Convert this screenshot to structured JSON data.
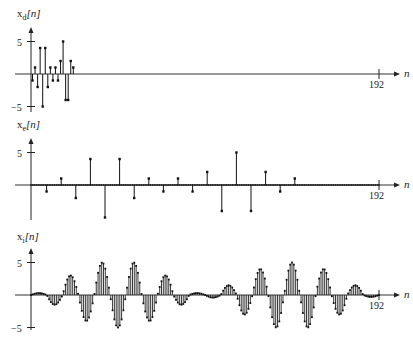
{
  "chart_data": [
    {
      "type": "stem",
      "title": "",
      "ylabel": "x_d[n]",
      "xlabel": "n",
      "x_end_tick": "192",
      "yticks": [
        "5",
        "-5"
      ],
      "ylim": [
        -5,
        5
      ],
      "xlim": [
        0,
        192
      ],
      "x": [
        0,
        1,
        2,
        3,
        4,
        5,
        6,
        7,
        8,
        9,
        10,
        11,
        12,
        13,
        14,
        15,
        16
      ],
      "values": [
        -1,
        1,
        -2,
        4,
        -5,
        4,
        -2,
        1,
        -1,
        1,
        -1,
        2,
        5,
        -4,
        -4,
        2,
        1
      ]
    },
    {
      "type": "stem",
      "title": "",
      "ylabel": "x_e[n]",
      "xlabel": "n",
      "x_end_tick": "192",
      "yticks": [
        "5",
        ""
      ],
      "ylim": [
        -5,
        5
      ],
      "xlim": [
        0,
        192
      ],
      "x": [
        0,
        12,
        24,
        36,
        48,
        60,
        72,
        84,
        96,
        108,
        120,
        132,
        144,
        156,
        168,
        180
      ],
      "values": [
        0,
        -1,
        1,
        -2,
        4,
        -5,
        4,
        -2,
        1,
        -1,
        1,
        -1,
        2,
        -4,
        5,
        -4,
        2,
        -1,
        1
      ]
    },
    {
      "type": "stem",
      "title": "",
      "ylabel": "x_i[n]",
      "xlabel": "n",
      "x_end_tick": "192",
      "yticks": [
        "5",
        "-5"
      ],
      "ylim": [
        -5,
        5
      ],
      "xlim": [
        0,
        192
      ],
      "description": "Interpolated modulated sinusoid: 192 samples, envelope bursts peaking near ±5"
    }
  ],
  "panels": [
    {
      "label": "x",
      "sub": "d",
      "arg": "[n]",
      "tick_pos": "5",
      "tick_neg": "−5",
      "end": "192",
      "axis": "n"
    },
    {
      "label": "x",
      "sub": "e",
      "arg": "[n]",
      "tick_pos": "5",
      "tick_neg": "",
      "end": "192",
      "axis": "n"
    },
    {
      "label": "x",
      "sub": "i",
      "arg": "[n]",
      "tick_pos": "5",
      "tick_neg": "−5",
      "end": "192",
      "axis": "n"
    }
  ]
}
